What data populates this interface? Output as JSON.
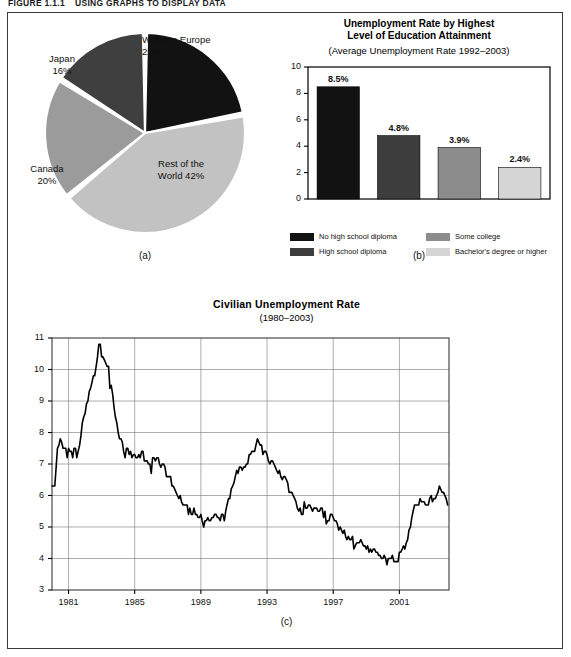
{
  "figure": {
    "number": "FIGURE 1.1.1",
    "caption": "USING GRAPHS TO DISPLAY DATA"
  },
  "panel_a": {
    "sublabel": "(a)",
    "labels": {
      "western_europe": "Western Europe\n22%",
      "western_europe_name": "Western Europe",
      "western_europe_pct": "22%",
      "japan_name": "Japan",
      "japan_pct": "16%",
      "canada_name": "Canada",
      "canada_pct": "20%",
      "rest_name": "Rest of the",
      "rest_pct": "World 42%"
    }
  },
  "panel_b": {
    "sublabel": "(b)",
    "title_line1": "Unemployment Rate by Highest",
    "title_line2": "Level of Education Attainment",
    "subtitle": "(Average Unemployment Rate 1992–2003)",
    "legend": [
      {
        "label": "No high school diploma",
        "color": "#121212"
      },
      {
        "label": "Some college",
        "color": "#8c8c8c"
      },
      {
        "label": "High school diploma",
        "color": "#3d3d3d"
      },
      {
        "label": "Bachelor's degree or higher",
        "color": "#d5d5d5"
      }
    ]
  },
  "panel_c": {
    "sublabel": "(c)",
    "title": "Civilian Unemployment  Rate",
    "subtitle": "(1980–2003)"
  },
  "chart_data": [
    {
      "type": "pie",
      "id": "panel-a-pie",
      "title": "",
      "legend_position": "outside-labels",
      "slices": [
        {
          "label": "Western Europe",
          "value": 22,
          "display": "22%",
          "color": "#121212"
        },
        {
          "label": "Rest of the World",
          "value": 42,
          "display": "42%",
          "color": "#c2c2c2"
        },
        {
          "label": "Canada",
          "value": 20,
          "display": "20%",
          "color": "#9b9b9b"
        },
        {
          "label": "Japan",
          "value": 16,
          "display": "16%",
          "color": "#3f3f3f"
        }
      ]
    },
    {
      "type": "bar",
      "id": "panel-b-bar",
      "title": "Unemployment Rate by Highest Level of Education Attainment",
      "subtitle": "(Average Unemployment Rate 1992–2003)",
      "xlabel": "",
      "ylabel": "",
      "ylim": [
        0,
        10
      ],
      "yticks": [
        0,
        2,
        4,
        6,
        8,
        10
      ],
      "grid": false,
      "categories": [
        "No high school diploma",
        "High school diploma",
        "Some college",
        "Bachelor's degree or higher"
      ],
      "values": [
        8.5,
        4.8,
        3.9,
        2.4
      ],
      "value_labels": [
        "8.5%",
        "4.8%",
        "3.9%",
        "2.4%"
      ],
      "colors": [
        "#121212",
        "#3d3d3d",
        "#8c8c8c",
        "#d5d5d5"
      ]
    },
    {
      "type": "line",
      "id": "panel-c-line",
      "title": "Civilian Unemployment Rate",
      "subtitle": "(1980–2003)",
      "xlabel": "",
      "ylabel": "",
      "xlim": [
        1980,
        2004
      ],
      "ylim": [
        3,
        11
      ],
      "yticks": [
        3,
        4,
        5,
        6,
        7,
        8,
        9,
        10,
        11
      ],
      "xticks": [
        1981,
        1985,
        1989,
        1993,
        1997,
        2001
      ],
      "grid": true,
      "series": [
        {
          "name": "Civilian Unemployment Rate",
          "color": "#000000",
          "x": [
            1980.0,
            1980.08,
            1980.17,
            1980.25,
            1980.33,
            1980.42,
            1980.5,
            1980.58,
            1980.67,
            1980.75,
            1980.83,
            1980.92,
            1981.0,
            1981.08,
            1981.17,
            1981.25,
            1981.33,
            1981.42,
            1981.5,
            1981.58,
            1981.67,
            1981.75,
            1981.83,
            1981.92,
            1982.0,
            1982.08,
            1982.17,
            1982.25,
            1982.33,
            1982.42,
            1982.5,
            1982.58,
            1982.67,
            1982.75,
            1982.83,
            1982.92,
            1983.0,
            1983.08,
            1983.17,
            1983.25,
            1983.33,
            1983.42,
            1983.5,
            1983.58,
            1983.67,
            1983.75,
            1983.83,
            1983.92,
            1984.0,
            1984.08,
            1984.17,
            1984.25,
            1984.33,
            1984.42,
            1984.5,
            1984.58,
            1984.67,
            1984.75,
            1984.83,
            1984.92,
            1985.0,
            1985.08,
            1985.17,
            1985.25,
            1985.33,
            1985.42,
            1985.5,
            1985.58,
            1985.67,
            1985.75,
            1985.83,
            1985.92,
            1986.0,
            1986.08,
            1986.17,
            1986.25,
            1986.33,
            1986.42,
            1986.5,
            1986.58,
            1986.67,
            1986.75,
            1986.83,
            1986.92,
            1987.0,
            1987.08,
            1987.17,
            1987.25,
            1987.33,
            1987.42,
            1987.5,
            1987.58,
            1987.67,
            1987.75,
            1987.83,
            1987.92,
            1988.0,
            1988.08,
            1988.17,
            1988.25,
            1988.33,
            1988.42,
            1988.5,
            1988.58,
            1988.67,
            1988.75,
            1988.83,
            1988.92,
            1989.0,
            1989.08,
            1989.17,
            1989.25,
            1989.33,
            1989.42,
            1989.5,
            1989.58,
            1989.67,
            1989.75,
            1989.83,
            1989.92,
            1990.0,
            1990.08,
            1990.17,
            1990.25,
            1990.33,
            1990.42,
            1990.5,
            1990.58,
            1990.67,
            1990.75,
            1990.83,
            1990.92,
            1991.0,
            1991.08,
            1991.17,
            1991.25,
            1991.33,
            1991.42,
            1991.5,
            1991.58,
            1991.67,
            1991.75,
            1991.83,
            1991.92,
            1992.0,
            1992.08,
            1992.17,
            1992.25,
            1992.33,
            1992.42,
            1992.5,
            1992.58,
            1992.67,
            1992.75,
            1992.83,
            1992.92,
            1993.0,
            1993.08,
            1993.17,
            1993.25,
            1993.33,
            1993.42,
            1993.5,
            1993.58,
            1993.67,
            1993.75,
            1993.83,
            1993.92,
            1994.0,
            1994.08,
            1994.17,
            1994.25,
            1994.33,
            1994.42,
            1994.5,
            1994.58,
            1994.67,
            1994.75,
            1994.83,
            1994.92,
            1995.0,
            1995.08,
            1995.17,
            1995.25,
            1995.33,
            1995.42,
            1995.5,
            1995.58,
            1995.67,
            1995.75,
            1995.83,
            1995.92,
            1996.0,
            1996.08,
            1996.17,
            1996.25,
            1996.33,
            1996.42,
            1996.5,
            1996.58,
            1996.67,
            1996.75,
            1996.83,
            1996.92,
            1997.0,
            1997.08,
            1997.17,
            1997.25,
            1997.33,
            1997.42,
            1997.5,
            1997.58,
            1997.67,
            1997.75,
            1997.83,
            1997.92,
            1998.0,
            1998.08,
            1998.17,
            1998.25,
            1998.33,
            1998.42,
            1998.5,
            1998.58,
            1998.67,
            1998.75,
            1998.83,
            1998.92,
            1999.0,
            1999.08,
            1999.17,
            1999.25,
            1999.33,
            1999.42,
            1999.5,
            1999.58,
            1999.67,
            1999.75,
            1999.83,
            1999.92,
            2000.0,
            2000.08,
            2000.17,
            2000.25,
            2000.33,
            2000.42,
            2000.5,
            2000.58,
            2000.67,
            2000.75,
            2000.83,
            2000.92,
            2001.0,
            2001.08,
            2001.17,
            2001.25,
            2001.33,
            2001.42,
            2001.5,
            2001.58,
            2001.67,
            2001.75,
            2001.83,
            2001.92,
            2002.0,
            2002.08,
            2002.17,
            2002.25,
            2002.33,
            2002.42,
            2002.5,
            2002.58,
            2002.67,
            2002.75,
            2002.83,
            2002.92,
            2003.0,
            2003.08,
            2003.17,
            2003.25,
            2003.33,
            2003.42,
            2003.5,
            2003.58,
            2003.67,
            2003.75,
            2003.83,
            2003.92
          ],
          "y": [
            6.3,
            6.3,
            6.3,
            6.9,
            7.5,
            7.6,
            7.8,
            7.7,
            7.5,
            7.5,
            7.5,
            7.2,
            7.5,
            7.4,
            7.4,
            7.2,
            7.5,
            7.5,
            7.2,
            7.4,
            7.6,
            7.9,
            8.3,
            8.5,
            8.6,
            8.9,
            9.0,
            9.3,
            9.4,
            9.6,
            9.8,
            9.8,
            10.1,
            10.4,
            10.8,
            10.8,
            10.4,
            10.4,
            10.3,
            10.2,
            10.1,
            10.1,
            9.4,
            9.5,
            9.2,
            8.8,
            8.5,
            8.3,
            8.0,
            7.8,
            7.8,
            7.7,
            7.4,
            7.2,
            7.5,
            7.5,
            7.3,
            7.4,
            7.2,
            7.3,
            7.3,
            7.2,
            7.2,
            7.3,
            7.2,
            7.4,
            7.4,
            7.1,
            7.1,
            7.1,
            7.0,
            7.0,
            6.7,
            7.2,
            7.2,
            7.1,
            7.2,
            7.2,
            7.0,
            6.9,
            7.0,
            7.0,
            6.9,
            6.6,
            6.6,
            6.6,
            6.6,
            6.3,
            6.3,
            6.2,
            6.1,
            6.0,
            5.9,
            6.0,
            5.8,
            5.7,
            5.7,
            5.7,
            5.7,
            5.4,
            5.6,
            5.4,
            5.4,
            5.6,
            5.4,
            5.4,
            5.3,
            5.3,
            5.4,
            5.2,
            5.0,
            5.2,
            5.2,
            5.3,
            5.2,
            5.2,
            5.3,
            5.3,
            5.4,
            5.4,
            5.3,
            5.3,
            5.2,
            5.4,
            5.4,
            5.2,
            5.5,
            5.7,
            5.9,
            5.9,
            6.2,
            6.3,
            6.4,
            6.6,
            6.8,
            6.7,
            6.9,
            6.9,
            6.8,
            6.9,
            6.9,
            7.0,
            7.0,
            7.3,
            7.3,
            7.4,
            7.4,
            7.4,
            7.6,
            7.8,
            7.7,
            7.6,
            7.6,
            7.3,
            7.4,
            7.4,
            7.3,
            7.1,
            7.0,
            7.1,
            7.1,
            7.0,
            6.9,
            6.8,
            6.7,
            6.8,
            6.6,
            6.5,
            6.6,
            6.6,
            6.5,
            6.4,
            6.1,
            6.1,
            6.1,
            6.0,
            5.9,
            5.8,
            5.6,
            5.5,
            5.6,
            5.4,
            5.4,
            5.8,
            5.6,
            5.6,
            5.7,
            5.7,
            5.6,
            5.5,
            5.6,
            5.6,
            5.6,
            5.5,
            5.5,
            5.6,
            5.6,
            5.3,
            5.5,
            5.1,
            5.2,
            5.2,
            5.4,
            5.4,
            5.3,
            5.2,
            5.2,
            5.1,
            4.9,
            5.0,
            4.9,
            4.8,
            4.9,
            4.7,
            4.6,
            4.7,
            4.6,
            4.6,
            4.7,
            4.3,
            4.4,
            4.5,
            4.5,
            4.5,
            4.6,
            4.5,
            4.4,
            4.4,
            4.3,
            4.4,
            4.2,
            4.3,
            4.2,
            4.3,
            4.3,
            4.2,
            4.2,
            4.1,
            4.1,
            4.0,
            4.0,
            4.1,
            4.0,
            3.8,
            4.0,
            4.0,
            4.0,
            4.1,
            3.9,
            3.9,
            3.9,
            3.9,
            4.2,
            4.2,
            4.3,
            4.4,
            4.3,
            4.5,
            4.6,
            4.9,
            5.0,
            5.3,
            5.5,
            5.7,
            5.7,
            5.7,
            5.7,
            5.9,
            5.8,
            5.8,
            5.8,
            5.7,
            5.7,
            5.7,
            5.9,
            6.0,
            5.8,
            5.9,
            5.9,
            6.0,
            6.1,
            6.3,
            6.2,
            6.1,
            6.1,
            6.0,
            5.9,
            5.7
          ]
        }
      ]
    }
  ]
}
